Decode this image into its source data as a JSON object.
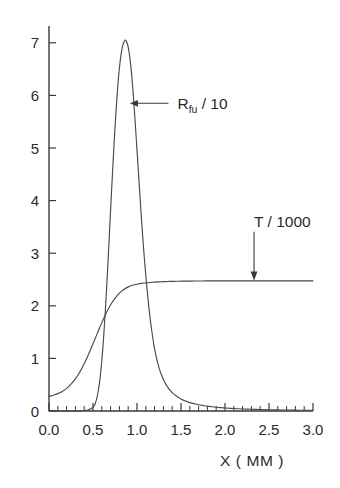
{
  "chart_data": {
    "type": "line",
    "title": "",
    "subtitle": "",
    "xlabel": "X ( MM )",
    "ylabel": "",
    "xlim": [
      0.0,
      3.0
    ],
    "ylim": [
      0.0,
      7.3
    ],
    "grid": false,
    "legend_position": "inline-annotations",
    "xticks": [
      0.0,
      0.5,
      1.0,
      1.5,
      2.0,
      2.5,
      3.0
    ],
    "xticklabels": [
      "0.0",
      "0.5",
      "1.0",
      "1.5",
      "2.0",
      "2.5",
      "3.0"
    ],
    "xminor_step": 0.1,
    "yticks": [
      0,
      1,
      2,
      3,
      4,
      5,
      6,
      7
    ],
    "yticklabels": [
      "0",
      "1",
      "2",
      "3",
      "4",
      "5",
      "6",
      "7"
    ],
    "annotations": [
      {
        "name": "rfu-label",
        "text_main": "R",
        "text_sub": "fu",
        "text_tail": " / 10",
        "x": 1.46,
        "y": 5.85,
        "arrow_to_x": 0.92,
        "arrow_to_y": 5.85,
        "arrow_direction": "left"
      },
      {
        "name": "t-label",
        "text_main": "T / 1000",
        "text_sub": "",
        "text_tail": "",
        "x": 2.33,
        "y": 3.6,
        "arrow_to_x": 2.33,
        "arrow_to_y": 2.48,
        "arrow_direction": "down"
      }
    ],
    "series": [
      {
        "name": "R_fu / 10",
        "label": "R_fu / 10",
        "color": "#4a4a4a",
        "peak_x": 0.87,
        "peak_y": 7.05,
        "x": [
          0.0,
          0.1,
          0.2,
          0.3,
          0.35,
          0.4,
          0.44,
          0.47,
          0.5,
          0.52,
          0.54,
          0.56,
          0.58,
          0.6,
          0.62,
          0.64,
          0.66,
          0.68,
          0.7,
          0.72,
          0.74,
          0.76,
          0.78,
          0.8,
          0.82,
          0.84,
          0.86,
          0.87,
          0.88,
          0.9,
          0.92,
          0.94,
          0.96,
          0.98,
          1.0,
          1.02,
          1.04,
          1.06,
          1.08,
          1.1,
          1.13,
          1.16,
          1.2,
          1.25,
          1.3,
          1.35,
          1.4,
          1.45,
          1.5,
          1.55,
          1.6,
          1.65,
          1.7,
          1.75,
          1.8,
          1.85,
          1.9,
          1.95,
          2.0,
          2.1,
          2.2,
          2.3,
          2.4,
          2.5,
          2.6,
          2.7,
          2.8,
          2.9,
          3.0
        ],
        "y": [
          0.0,
          0.0,
          0.0,
          0.0,
          0.0,
          0.01,
          0.02,
          0.04,
          0.07,
          0.12,
          0.22,
          0.38,
          0.62,
          0.95,
          1.38,
          1.9,
          2.5,
          3.15,
          3.82,
          4.48,
          5.1,
          5.66,
          6.14,
          6.52,
          6.79,
          6.96,
          7.04,
          7.05,
          7.03,
          6.92,
          6.7,
          6.38,
          5.96,
          5.48,
          4.96,
          4.44,
          3.92,
          3.43,
          2.98,
          2.58,
          2.05,
          1.62,
          1.18,
          0.82,
          0.6,
          0.45,
          0.35,
          0.28,
          0.23,
          0.19,
          0.16,
          0.14,
          0.12,
          0.105,
          0.092,
          0.081,
          0.072,
          0.064,
          0.058,
          0.047,
          0.039,
          0.033,
          0.028,
          0.024,
          0.021,
          0.018,
          0.016,
          0.014,
          0.012
        ]
      },
      {
        "name": "T / 1000",
        "label": "T / 1000",
        "color": "#4a4a4a",
        "start_y": 0.28,
        "plateau_y": 2.47,
        "x": [
          0.0,
          0.05,
          0.1,
          0.15,
          0.2,
          0.25,
          0.3,
          0.35,
          0.4,
          0.45,
          0.5,
          0.55,
          0.6,
          0.65,
          0.7,
          0.75,
          0.8,
          0.85,
          0.9,
          0.95,
          1.0,
          1.05,
          1.1,
          1.15,
          1.2,
          1.25,
          1.3,
          1.35,
          1.4,
          1.45,
          1.5,
          1.55,
          1.6,
          1.65,
          1.7,
          1.75,
          1.8,
          1.9,
          2.0,
          2.2,
          2.4,
          2.6,
          2.8,
          3.0
        ],
        "y": [
          0.28,
          0.3,
          0.33,
          0.37,
          0.43,
          0.51,
          0.61,
          0.74,
          0.9,
          1.08,
          1.28,
          1.48,
          1.68,
          1.86,
          2.02,
          2.14,
          2.24,
          2.31,
          2.36,
          2.39,
          2.41,
          2.425,
          2.435,
          2.443,
          2.45,
          2.455,
          2.459,
          2.462,
          2.464,
          2.466,
          2.468,
          2.469,
          2.47,
          2.471,
          2.472,
          2.472,
          2.473,
          2.473,
          2.474,
          2.474,
          2.475,
          2.475,
          2.475,
          2.475
        ]
      }
    ]
  },
  "figure": {
    "background": "#ffffff",
    "axis_color": "#3a3a3a",
    "curve_color": "#4a4a4a"
  }
}
